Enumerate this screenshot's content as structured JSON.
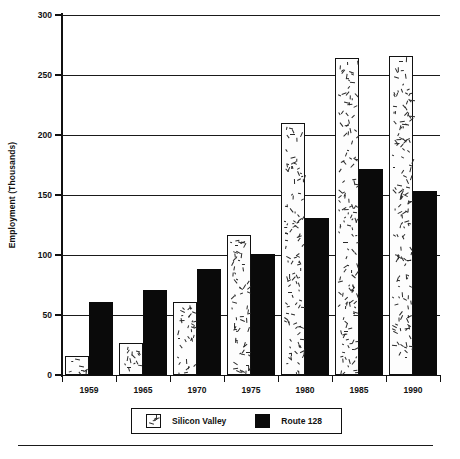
{
  "chart_data": {
    "type": "bar",
    "title": "",
    "xlabel": "",
    "ylabel": "Employment (Thousands)",
    "categories": [
      "1959",
      "1965",
      "1970",
      "1975",
      "1980",
      "1985",
      "1990"
    ],
    "series": [
      {
        "name": "Silicon Valley",
        "values": [
          16,
          27,
          61,
          117,
          210,
          264,
          266
        ],
        "pattern": "speckled-white"
      },
      {
        "name": "Route 128",
        "values": [
          61,
          71,
          88,
          101,
          131,
          172,
          153
        ],
        "pattern": "solid-black"
      }
    ],
    "ylim": [
      0,
      300
    ],
    "yticks": [
      0,
      50,
      100,
      150,
      200,
      250,
      300
    ],
    "ytick_labels": [
      "0",
      "50",
      "100",
      "150",
      "200",
      "250",
      "300"
    ],
    "grid": true,
    "grid_axis": "y",
    "legend_position": "bottom"
  },
  "legend": {
    "entries": [
      {
        "label": "Silicon Valley",
        "swatch": "speckled-white-swatch"
      },
      {
        "label": "Route 128",
        "swatch": "solid-black-swatch"
      }
    ]
  },
  "colors": {
    "silicon_valley": "#fdfdfd",
    "route_128": "#0a0a0a",
    "axis": "#111111",
    "background": "#ffffff"
  }
}
